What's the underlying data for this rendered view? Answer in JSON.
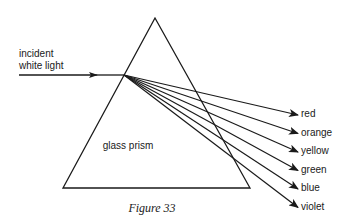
{
  "figure": {
    "caption": "Figure 33",
    "prism_label": "glass prism",
    "incident_label_line1": "incident",
    "incident_label_line2": "white light",
    "spectrum": [
      {
        "name": "red"
      },
      {
        "name": "orange"
      },
      {
        "name": "yellow"
      },
      {
        "name": "green"
      },
      {
        "name": "blue"
      },
      {
        "name": "violet"
      }
    ]
  }
}
